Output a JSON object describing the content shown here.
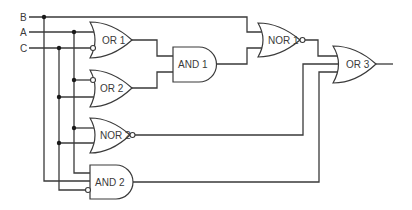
{
  "diagram": {
    "title": "",
    "inputs": [
      {
        "id": "B",
        "label": "B"
      },
      {
        "id": "A",
        "label": "A"
      },
      {
        "id": "C",
        "label": "C"
      }
    ],
    "gates": [
      {
        "id": "or1",
        "type": "OR",
        "label": "OR 1",
        "inputs": [
          "A",
          "NOT C"
        ]
      },
      {
        "id": "or2",
        "type": "OR",
        "label": "OR 2",
        "inputs": [
          "NOT A",
          "C"
        ]
      },
      {
        "id": "and1",
        "type": "AND",
        "label": "AND 1",
        "inputs": [
          "OR 1",
          "OR 2"
        ]
      },
      {
        "id": "nor1",
        "type": "NOR",
        "label": "NOR 1",
        "inputs": [
          "B",
          "AND 1"
        ]
      },
      {
        "id": "nor2",
        "type": "NOR",
        "label": "NOR 2",
        "inputs": [
          "A",
          "C"
        ]
      },
      {
        "id": "and2",
        "type": "AND",
        "label": "AND 2",
        "inputs": [
          "A",
          "B",
          "NOT C"
        ]
      },
      {
        "id": "or3",
        "type": "OR",
        "label": "OR 3",
        "inputs": [
          "NOR 1",
          "NOR 2",
          "AND 2"
        ]
      }
    ],
    "colors": {
      "line": "#3a3a3a",
      "background": "#ffffff"
    }
  }
}
